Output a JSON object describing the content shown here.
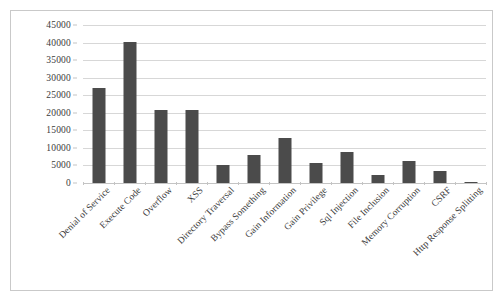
{
  "chart_data": {
    "type": "bar",
    "title": "",
    "subtitle": "",
    "xlabel": "",
    "ylabel": "",
    "ylim": [
      0,
      45000
    ],
    "ytick_step": 5000,
    "yticks": [
      "0",
      "5000",
      "10000",
      "15000",
      "20000",
      "25000",
      "30000",
      "35000",
      "40000",
      "45000"
    ],
    "grid": true,
    "legend": false,
    "legend_position": "none",
    "bar_color": "#4b4b4b",
    "gridline_color": "#d7d7d7",
    "categories": [
      "Denial of Service",
      "Execute Code",
      "Overflow",
      "XSS",
      "Directory Traversal",
      "Bypass Something",
      "Gain Information",
      "Gain Privilege",
      "Sql Injection",
      "File Inclusion",
      "Memory Corruption",
      "CSRF",
      "Http Response Splitting"
    ],
    "values": [
      27000,
      40300,
      20700,
      20700,
      5200,
      8100,
      12700,
      5600,
      8800,
      2300,
      6200,
      3400,
      250
    ]
  }
}
